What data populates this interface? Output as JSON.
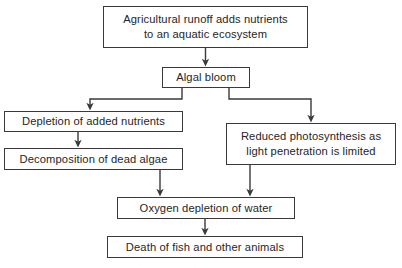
{
  "diagram": {
    "stroke_color": "#3a3a3a",
    "text_color": "#262626",
    "background_color": "#ffffff",
    "nodes": [
      {
        "id": "runoff",
        "label": "Agricultural runoff adds nutrients\nto an aquatic ecosystem"
      },
      {
        "id": "algal",
        "label": "Algal bloom"
      },
      {
        "id": "depletion",
        "label": "Depletion of added nutrients"
      },
      {
        "id": "decomp",
        "label": "Decomposition of dead algae"
      },
      {
        "id": "photo",
        "label": "Reduced photosynthesis as\nlight penetration is limited"
      },
      {
        "id": "oxygen",
        "label": "Oxygen depletion of water"
      },
      {
        "id": "death",
        "label": "Death of fish and other animals"
      }
    ],
    "edges": [
      {
        "id": "runoff-to-algal",
        "from": "runoff",
        "to": "algal"
      },
      {
        "id": "algal-to-depletion",
        "from": "algal",
        "to": "depletion"
      },
      {
        "id": "algal-to-photo",
        "from": "algal",
        "to": "photo"
      },
      {
        "id": "depletion-to-decomp",
        "from": "depletion",
        "to": "decomp"
      },
      {
        "id": "decomp-to-oxygen",
        "from": "decomp",
        "to": "oxygen"
      },
      {
        "id": "photo-to-oxygen",
        "from": "photo",
        "to": "oxygen"
      },
      {
        "id": "oxygen-to-death",
        "from": "oxygen",
        "to": "death"
      }
    ]
  }
}
